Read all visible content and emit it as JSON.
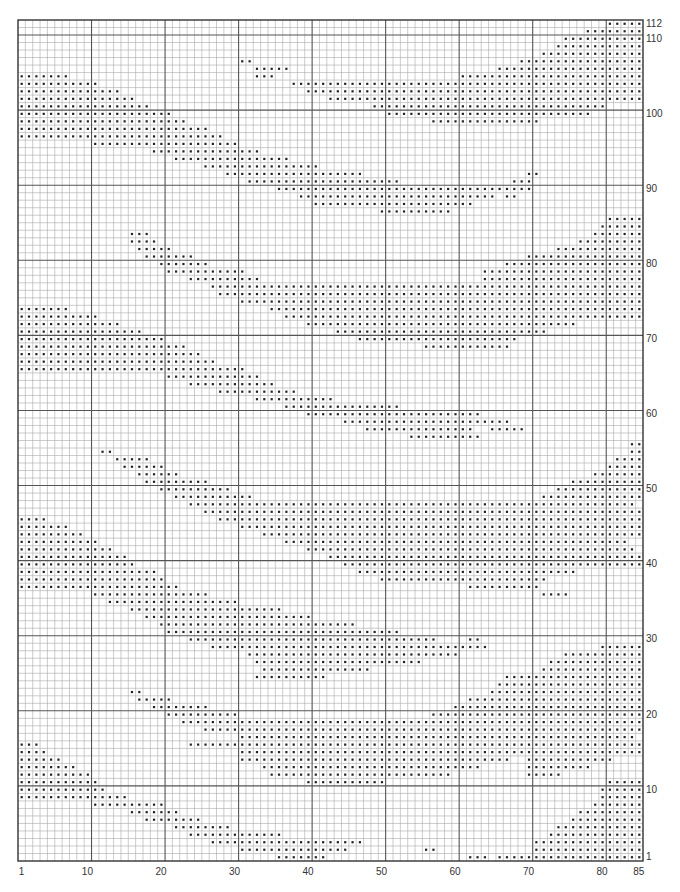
{
  "chart": {
    "columns": 85,
    "rows": 112,
    "grid": {
      "left": 18,
      "top": 20,
      "right": 643,
      "bottom": 861
    },
    "colors": {
      "fine": "#a9a9a9",
      "major": "#555555",
      "border": "#333333",
      "dot": "#222222"
    },
    "major_every": 10,
    "x_labels": [
      {
        "col": 1,
        "text": "1"
      },
      {
        "col": 10,
        "text": "10"
      },
      {
        "col": 20,
        "text": "20"
      },
      {
        "col": 30,
        "text": "30"
      },
      {
        "col": 40,
        "text": "40"
      },
      {
        "col": 50,
        "text": "50"
      },
      {
        "col": 60,
        "text": "60"
      },
      {
        "col": 70,
        "text": "70"
      },
      {
        "col": 80,
        "text": "80"
      },
      {
        "col": 85,
        "text": "85"
      }
    ],
    "y_labels": [
      {
        "row": 1,
        "text": "1"
      },
      {
        "row": 10,
        "text": "10"
      },
      {
        "row": 20,
        "text": "20"
      },
      {
        "row": 30,
        "text": "30"
      },
      {
        "row": 40,
        "text": "40"
      },
      {
        "row": 50,
        "text": "50"
      },
      {
        "row": 60,
        "text": "60"
      },
      {
        "row": 70,
        "text": "70"
      },
      {
        "row": 80,
        "text": "80"
      },
      {
        "row": 90,
        "text": "90"
      },
      {
        "row": 100,
        "text": "100"
      },
      {
        "row": 110,
        "text": "110"
      },
      {
        "row": 112,
        "text": "112"
      }
    ],
    "filled_runs": {
      "1": [
        [
          36,
          42
        ],
        [
          62,
          64
        ],
        [
          66,
          85
        ]
      ],
      "2": [
        [
          31,
          45
        ],
        [
          56,
          57
        ],
        [
          71,
          85
        ]
      ],
      "3": [
        [
          27,
          47
        ],
        [
          71,
          85
        ]
      ],
      "4": [
        [
          24,
          36
        ],
        [
          73,
          85
        ]
      ],
      "5": [
        [
          22,
          29
        ],
        [
          74,
          85
        ]
      ],
      "6": [
        [
          18,
          25
        ],
        [
          76,
          85
        ]
      ],
      "7": [
        [
          16,
          22
        ],
        [
          77,
          85
        ]
      ],
      "8": [
        [
          11,
          20
        ],
        [
          79,
          85
        ]
      ],
      "9": [
        [
          1,
          15
        ],
        [
          80,
          85
        ]
      ],
      "10": [
        [
          1,
          12
        ],
        [
          80,
          85
        ]
      ],
      "11": [
        [
          1,
          11
        ],
        [
          40,
          50
        ],
        [
          81,
          85
        ]
      ],
      "12": [
        [
          1,
          10
        ],
        [
          35,
          59
        ],
        [
          70,
          74
        ]
      ],
      "13": [
        [
          1,
          8
        ],
        [
          34,
          63
        ],
        [
          70,
          78
        ]
      ],
      "14": [
        [
          1,
          6
        ],
        [
          31,
          67
        ],
        [
          70,
          81
        ]
      ],
      "15": [
        [
          1,
          4
        ],
        [
          31,
          85
        ]
      ],
      "16": [
        [
          1,
          3
        ],
        [
          24,
          85
        ]
      ],
      "17": [
        [
          31,
          84
        ]
      ],
      "18": [
        [
          26,
          85
        ]
      ],
      "19": [
        [
          23,
          85
        ]
      ],
      "20": [
        [
          21,
          30
        ],
        [
          57,
          85
        ]
      ],
      "21": [
        [
          19,
          26
        ],
        [
          60,
          85
        ]
      ],
      "22": [
        [
          17,
          21
        ],
        [
          62,
          85
        ]
      ],
      "23": [
        [
          16,
          17
        ],
        [
          65,
          85
        ]
      ],
      "24": [
        [
          66,
          85
        ]
      ],
      "25": [
        [
          33,
          42
        ],
        [
          67,
          85
        ]
      ],
      "26": [
        [
          34,
          48
        ],
        [
          72,
          85
        ]
      ],
      "27": [
        [
          33,
          55
        ],
        [
          73,
          85
        ]
      ],
      "28": [
        [
          32,
          60
        ],
        [
          75,
          85
        ]
      ],
      "29": [
        [
          27,
          64
        ],
        [
          80,
          85
        ]
      ],
      "30": [
        [
          24,
          57
        ],
        [
          62,
          63
        ]
      ],
      "31": [
        [
          21,
          52
        ]
      ],
      "32": [
        [
          20,
          46
        ]
      ],
      "33": [
        [
          18,
          40
        ]
      ],
      "34": [
        [
          16,
          36
        ]
      ],
      "35": [
        [
          13,
          30
        ]
      ],
      "36": [
        [
          11,
          26
        ],
        [
          72,
          75
        ]
      ],
      "37": [
        [
          1,
          22
        ],
        [
          62,
          71
        ]
      ],
      "38": [
        [
          1,
          20
        ],
        [
          50,
          72
        ]
      ],
      "39": [
        [
          1,
          19
        ],
        [
          47,
          76
        ]
      ],
      "40": [
        [
          1,
          16
        ],
        [
          45,
          85
        ]
      ],
      "41": [
        [
          1,
          15
        ],
        [
          43,
          85
        ]
      ],
      "42": [
        [
          1,
          13
        ],
        [
          40,
          84
        ]
      ],
      "43": [
        [
          1,
          11
        ],
        [
          37,
          83
        ]
      ],
      "44": [
        [
          1,
          9
        ],
        [
          34,
          85
        ]
      ],
      "45": [
        [
          1,
          7
        ],
        [
          31,
          85
        ]
      ],
      "46": [
        [
          1,
          4
        ],
        [
          28,
          85
        ]
      ],
      "47": [
        [
          26,
          85
        ]
      ],
      "48": [
        [
          24,
          84
        ]
      ],
      "49": [
        [
          22,
          32
        ],
        [
          72,
          85
        ]
      ],
      "50": [
        [
          20,
          29
        ],
        [
          74,
          85
        ]
      ],
      "51": [
        [
          18,
          26
        ],
        [
          76,
          85
        ]
      ],
      "52": [
        [
          17,
          22
        ],
        [
          79,
          85
        ]
      ],
      "53": [
        [
          15,
          20
        ],
        [
          81,
          85
        ]
      ],
      "54": [
        [
          14,
          18
        ],
        [
          82,
          85
        ]
      ],
      "55": [
        [
          12,
          13
        ],
        [
          84,
          85
        ]
      ],
      "56": [
        [
          84,
          85
        ]
      ],
      "57": [
        [
          54,
          63
        ]
      ],
      "58": [
        [
          48,
          62
        ],
        [
          65,
          69
        ]
      ],
      "59": [
        [
          45,
          67
        ]
      ],
      "60": [
        [
          40,
          63
        ]
      ],
      "61": [
        [
          37,
          52
        ]
      ],
      "62": [
        [
          33,
          43
        ]
      ],
      "63": [
        [
          28,
          38
        ]
      ],
      "64": [
        [
          24,
          35
        ]
      ],
      "65": [
        [
          21,
          33
        ]
      ],
      "66": [
        [
          1,
          31
        ]
      ],
      "67": [
        [
          1,
          27
        ]
      ],
      "68": [
        [
          1,
          25
        ]
      ],
      "69": [
        [
          1,
          23
        ],
        [
          56,
          67
        ]
      ],
      "70": [
        [
          1,
          20
        ],
        [
          47,
          68
        ]
      ],
      "71": [
        [
          1,
          17
        ],
        [
          44,
          72
        ]
      ],
      "72": [
        [
          1,
          14
        ],
        [
          40,
          76
        ]
      ],
      "73": [
        [
          1,
          11
        ],
        [
          37,
          85
        ]
      ],
      "74": [
        [
          1,
          7
        ],
        [
          35,
          85
        ]
      ],
      "75": [
        [
          31,
          85
        ]
      ],
      "76": [
        [
          28,
          85
        ]
      ],
      "77": [
        [
          27,
          85
        ]
      ],
      "78": [
        [
          24,
          33
        ],
        [
          64,
          85
        ]
      ],
      "79": [
        [
          21,
          31
        ],
        [
          64,
          85
        ]
      ],
      "80": [
        [
          20,
          26
        ],
        [
          67,
          85
        ]
      ],
      "81": [
        [
          18,
          24
        ],
        [
          70,
          85
        ]
      ],
      "82": [
        [
          17,
          21
        ],
        [
          74,
          85
        ]
      ],
      "83": [
        [
          16,
          19
        ],
        [
          77,
          85
        ]
      ],
      "84": [
        [
          16,
          18
        ],
        [
          79,
          85
        ]
      ],
      "85": [
        [
          80,
          85
        ]
      ],
      "86": [
        [
          81,
          85
        ]
      ],
      "87": [
        [
          50,
          59
        ]
      ],
      "88": [
        [
          41,
          62
        ]
      ],
      "89": [
        [
          39,
          65
        ],
        [
          67,
          68
        ]
      ],
      "90": [
        [
          36,
          70
        ]
      ],
      "91": [
        [
          32,
          52
        ],
        [
          68,
          70
        ]
      ],
      "92": [
        [
          29,
          47
        ],
        [
          70,
          71
        ]
      ],
      "93": [
        [
          26,
          41
        ]
      ],
      "94": [
        [
          22,
          37
        ]
      ],
      "95": [
        [
          19,
          33
        ]
      ],
      "96": [
        [
          11,
          30
        ]
      ],
      "97": [
        [
          1,
          28
        ]
      ],
      "98": [
        [
          1,
          26
        ]
      ],
      "99": [
        [
          1,
          23
        ],
        [
          57,
          71
        ]
      ],
      "100": [
        [
          1,
          21
        ],
        [
          51,
          78
        ]
      ],
      "101": [
        [
          1,
          18
        ],
        [
          49,
          80
        ]
      ],
      "102": [
        [
          1,
          16
        ],
        [
          43,
          85
        ]
      ],
      "103": [
        [
          1,
          14
        ],
        [
          40,
          85
        ]
      ],
      "104": [
        [
          1,
          11
        ],
        [
          38,
          85
        ]
      ],
      "105": [
        [
          1,
          7
        ],
        [
          33,
          35
        ],
        [
          61,
          85
        ]
      ],
      "106": [
        [
          33,
          37
        ],
        [
          66,
          85
        ]
      ],
      "107": [
        [
          31,
          32
        ],
        [
          69,
          85
        ]
      ],
      "108": [
        [
          72,
          85
        ]
      ],
      "109": [
        [
          74,
          85
        ]
      ],
      "110": [
        [
          75,
          85
        ]
      ],
      "111": [
        [
          78,
          85
        ]
      ],
      "112": [
        [
          81,
          85
        ]
      ]
    }
  }
}
